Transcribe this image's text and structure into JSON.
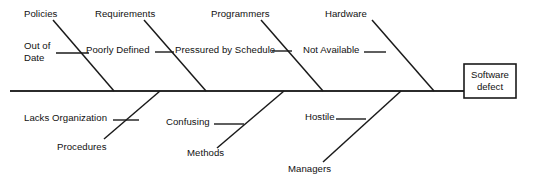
{
  "diagram": {
    "type": "fishbone-cause-and-effect",
    "effect": {
      "label": "Software\ndefect",
      "box": {
        "x": 464,
        "y": 64,
        "width": 52,
        "height": 34
      }
    },
    "spine": {
      "x1": 10,
      "y1": 91,
      "x2": 464,
      "y2": 91
    },
    "colors": {
      "line": "#1a1a1a",
      "spine": "#2b2b2b",
      "text": "#111111",
      "background": "#ffffff"
    },
    "categories": [
      {
        "id": "policies",
        "side": "top",
        "label": "Policies",
        "label_pos": {
          "x": 24,
          "y": 8
        },
        "bone": {
          "x1": 53,
          "y1": 20,
          "x2": 114,
          "y2": 91
        },
        "causes": [
          {
            "id": "out-of-date",
            "label": "Out of\nDate",
            "label_pos": {
              "x": 24,
              "y": 40
            },
            "tick": {
              "x1": 56,
              "y1": 53,
              "x2": 89,
              "y2": 53
            }
          }
        ]
      },
      {
        "id": "requirements",
        "side": "top",
        "label": "Requirements",
        "label_pos": {
          "x": 95,
          "y": 8
        },
        "bone": {
          "x1": 144,
          "y1": 20,
          "x2": 206,
          "y2": 91
        },
        "causes": [
          {
            "id": "poorly-defined",
            "label": "Poorly Defined",
            "label_pos": {
              "x": 86,
              "y": 44
            },
            "tick": {
              "x1": 155,
              "y1": 52,
              "x2": 174,
              "y2": 52
            }
          }
        ]
      },
      {
        "id": "programmers",
        "side": "top",
        "label": "Programmers",
        "label_pos": {
          "x": 211,
          "y": 8
        },
        "bone": {
          "x1": 261,
          "y1": 20,
          "x2": 323,
          "y2": 91
        },
        "causes": [
          {
            "id": "pressured-by-schedule",
            "label": "Pressured by Schedule",
            "label_pos": {
              "x": 175,
              "y": 44
            },
            "tick": {
              "x1": 272,
              "y1": 51,
              "x2": 292,
              "y2": 51
            }
          }
        ]
      },
      {
        "id": "hardware",
        "side": "top",
        "label": "Hardware",
        "label_pos": {
          "x": 325,
          "y": 8
        },
        "bone": {
          "x1": 372,
          "y1": 20,
          "x2": 434,
          "y2": 91
        },
        "causes": [
          {
            "id": "not-available",
            "label": "Not Available",
            "label_pos": {
              "x": 303,
              "y": 44
            },
            "tick": {
              "x1": 364,
              "y1": 52,
              "x2": 386,
              "y2": 52
            }
          }
        ]
      },
      {
        "id": "procedures",
        "side": "bottom",
        "label": "Procedures",
        "label_pos": {
          "x": 57,
          "y": 141
        },
        "bone": {
          "x1": 104,
          "y1": 139,
          "x2": 160,
          "y2": 91
        },
        "causes": [
          {
            "id": "lacks-organization",
            "label": "Lacks Organization",
            "label_pos": {
              "x": 24,
              "y": 112
            },
            "tick": {
              "x1": 113,
              "y1": 120,
              "x2": 139,
              "y2": 120
            }
          }
        ]
      },
      {
        "id": "methods",
        "side": "bottom",
        "label": "Methods",
        "label_pos": {
          "x": 187,
          "y": 147
        },
        "bone": {
          "x1": 217,
          "y1": 148,
          "x2": 284,
          "y2": 91
        },
        "causes": [
          {
            "id": "confusing",
            "label": "Confusing",
            "label_pos": {
              "x": 166,
              "y": 116
            },
            "tick": {
              "x1": 214,
              "y1": 124,
              "x2": 244,
              "y2": 124
            }
          }
        ]
      },
      {
        "id": "managers",
        "side": "bottom",
        "label": "Managers",
        "label_pos": {
          "x": 288,
          "y": 163
        },
        "bone": {
          "x1": 323,
          "y1": 162,
          "x2": 401,
          "y2": 91
        },
        "causes": [
          {
            "id": "hostile",
            "label": "Hostile",
            "label_pos": {
              "x": 305,
              "y": 111
            },
            "tick": {
              "x1": 336,
              "y1": 119,
              "x2": 366,
              "y2": 119
            }
          }
        ]
      }
    ]
  }
}
